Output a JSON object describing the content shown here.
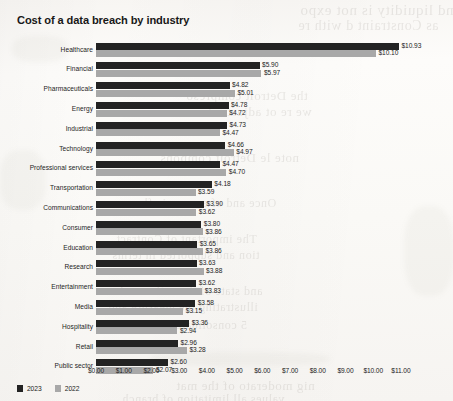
{
  "chart_data": {
    "type": "bar",
    "orientation": "horizontal",
    "title": "Cost of a data breach by industry",
    "xlabel": "",
    "ylabel": "",
    "xlim": [
      0,
      11
    ],
    "grid": false,
    "legend_position": "bottom-left",
    "value_prefix": "$",
    "categories": [
      "Healthcare",
      "Financial",
      "Pharmaceuticals",
      "Energy",
      "Industrial",
      "Technology",
      "Professional services",
      "Transportation",
      "Communications",
      "Consumer",
      "Education",
      "Research",
      "Entertainment",
      "Media",
      "Hospitality",
      "Retail",
      "Public sector"
    ],
    "series": [
      {
        "name": "2023",
        "color": "#232323",
        "values": [
          10.93,
          5.9,
          4.82,
          4.78,
          4.73,
          4.66,
          4.47,
          4.18,
          3.9,
          3.8,
          3.65,
          3.63,
          3.62,
          3.58,
          3.36,
          2.96,
          2.6
        ],
        "labels": [
          "$10.93",
          "$5.90",
          "$4.82",
          "$4.78",
          "$4.73",
          "$4.66",
          "$4.47",
          "$4.18",
          "$3.90",
          "$3.80",
          "$3.65",
          "$3.63",
          "$3.62",
          "$3.58",
          "$3.36",
          "$2.96",
          "$2.60"
        ]
      },
      {
        "name": "2022",
        "color": "#a8a8a8",
        "values": [
          10.1,
          5.97,
          5.01,
          4.72,
          4.47,
          4.97,
          4.7,
          3.59,
          3.62,
          3.86,
          3.86,
          3.88,
          3.83,
          3.15,
          2.94,
          3.28,
          2.07
        ],
        "labels": [
          "$10.10",
          "$5.97",
          "$5.01",
          "$4.72",
          "$4.47",
          "$4.97",
          "$4.70",
          "$3.59",
          "$3.62",
          "$3.86",
          "$3.86",
          "$3.88",
          "$3.83",
          "$3.15",
          "$2.94",
          "$3.28",
          "$2.07"
        ]
      }
    ],
    "xticks": [
      0,
      1,
      2,
      3,
      4,
      5,
      6,
      7,
      8,
      9,
      10,
      11
    ],
    "xtick_labels": [
      "$0.00",
      "$1.00",
      "$2.00",
      "$3.00",
      "$4.00",
      "$5.00",
      "$6.00",
      "$7.00",
      "$8.00",
      "$9.00",
      "$10.00",
      "$11.00"
    ]
  },
  "legend": {
    "items": [
      {
        "label": "2023",
        "color": "#232323"
      },
      {
        "label": "2022",
        "color": "#a8a8a8"
      }
    ]
  }
}
